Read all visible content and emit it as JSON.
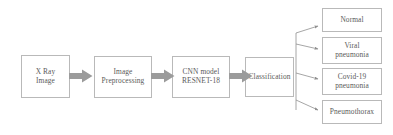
{
  "diagram": {
    "colors": {
      "box_border": "#b9b9b9",
      "text": "#5a5a5a",
      "arrow_fill": "#9b9b9b",
      "connector_line": "#8f8f8f",
      "background": "#ffffff"
    },
    "pipeline": [
      {
        "id": "xray",
        "label": "X Ray\nImage"
      },
      {
        "id": "preproc",
        "label": "Image\nPreprocessing"
      },
      {
        "id": "cnn",
        "label": "CNN model\nRESNET-18"
      },
      {
        "id": "classify",
        "label": "Classification"
      }
    ],
    "connectors": [
      {
        "id": "arrow-1",
        "from": "xray",
        "to": "preproc",
        "type": "block-arrow-right"
      },
      {
        "id": "arrow-2",
        "from": "preproc",
        "to": "cnn",
        "type": "block-arrow-right"
      },
      {
        "id": "arrow-3",
        "from": "cnn",
        "to": "classify",
        "type": "block-arrow-right"
      }
    ],
    "outputs": [
      {
        "id": "out-0",
        "label": "Normal"
      },
      {
        "id": "out-1",
        "label": "Viral\npneumonia"
      },
      {
        "id": "out-2",
        "label": "Covid-19\npneumonia"
      },
      {
        "id": "out-3",
        "label": "Pneumothorax"
      }
    ]
  }
}
